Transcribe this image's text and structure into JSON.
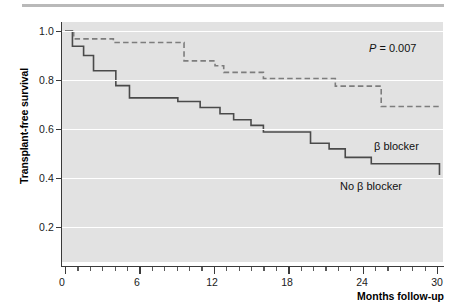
{
  "figure": {
    "title": "",
    "top_rule": true
  },
  "axes": {
    "x_title": "Months follow-up",
    "y_title": "Transplant-free survival",
    "x_ticks": [
      "0",
      "6",
      "12",
      "18",
      "24",
      "30"
    ],
    "y_ticks": [
      "1.0",
      "0.8",
      "0.6",
      "0.4",
      "0.2"
    ]
  },
  "annotations": {
    "p_symbol": "P",
    "p_text": " = 0.007",
    "p_full": "P = 0.007",
    "label_beta": "β blocker",
    "label_no_beta": "No β blocker"
  },
  "colors": {
    "plot_background": "#e2e2e2",
    "gridline": "#ffffff",
    "axis": "#3a3a3a",
    "curve_solid": "#4a4a4a",
    "curve_dashed": "#7d7d7d",
    "page_background": "#ffffff",
    "rule": "#b9b9b9"
  },
  "chart_data": {
    "type": "line",
    "subtype": "kaplan-meier-step",
    "title": "",
    "xlabel": "Months follow-up",
    "ylabel": "Transplant-free survival",
    "xlim": [
      0,
      30.7
    ],
    "ylim": [
      0,
      1.06
    ],
    "x_ticks": [
      0,
      6,
      12,
      18,
      24,
      30
    ],
    "y_ticks": [
      0.2,
      0.4,
      0.6,
      0.8,
      1.0
    ],
    "x_minor_tick_interval": 1,
    "grid": "horizontal-white",
    "legend": "inline-annotations",
    "annotations": [
      {
        "text": "P = 0.007",
        "x": 26.5,
        "y": 1.02
      },
      {
        "text": "β blocker",
        "x": 26.0,
        "y": 0.66
      },
      {
        "text": "No β blocker",
        "x": 23.5,
        "y": 0.5
      }
    ],
    "series": [
      {
        "name": "β blocker",
        "style": "dashed",
        "color": "#7d7d7d",
        "steps": [
          {
            "x": 0.0,
            "y": 1.0
          },
          {
            "x": 0.7,
            "y": 0.968
          },
          {
            "x": 3.9,
            "y": 0.953
          },
          {
            "x": 9.3,
            "y": 0.953
          },
          {
            "x": 9.6,
            "y": 0.878
          },
          {
            "x": 11.8,
            "y": 0.878
          },
          {
            "x": 12.1,
            "y": 0.858
          },
          {
            "x": 12.8,
            "y": 0.831
          },
          {
            "x": 15.7,
            "y": 0.831
          },
          {
            "x": 16.0,
            "y": 0.806
          },
          {
            "x": 21.5,
            "y": 0.806
          },
          {
            "x": 21.8,
            "y": 0.775
          },
          {
            "x": 25.2,
            "y": 0.775
          },
          {
            "x": 25.5,
            "y": 0.692
          },
          {
            "x": 30.2,
            "y": 0.692
          }
        ]
      },
      {
        "name": "No β blocker",
        "style": "solid",
        "color": "#4a4a4a",
        "steps": [
          {
            "x": 0.0,
            "y": 1.0
          },
          {
            "x": 0.6,
            "y": 0.938
          },
          {
            "x": 1.5,
            "y": 0.9
          },
          {
            "x": 2.0,
            "y": 0.9
          },
          {
            "x": 2.3,
            "y": 0.838
          },
          {
            "x": 3.8,
            "y": 0.838
          },
          {
            "x": 4.1,
            "y": 0.777
          },
          {
            "x": 4.9,
            "y": 0.777
          },
          {
            "x": 5.2,
            "y": 0.727
          },
          {
            "x": 8.8,
            "y": 0.727
          },
          {
            "x": 9.1,
            "y": 0.712
          },
          {
            "x": 10.6,
            "y": 0.712
          },
          {
            "x": 10.9,
            "y": 0.688
          },
          {
            "x": 12.2,
            "y": 0.688
          },
          {
            "x": 12.5,
            "y": 0.662
          },
          {
            "x": 13.3,
            "y": 0.662
          },
          {
            "x": 13.6,
            "y": 0.638
          },
          {
            "x": 14.7,
            "y": 0.638
          },
          {
            "x": 15.0,
            "y": 0.615
          },
          {
            "x": 15.7,
            "y": 0.615
          },
          {
            "x": 16.0,
            "y": 0.588
          },
          {
            "x": 19.5,
            "y": 0.588
          },
          {
            "x": 19.8,
            "y": 0.542
          },
          {
            "x": 21.0,
            "y": 0.542
          },
          {
            "x": 21.3,
            "y": 0.519
          },
          {
            "x": 22.3,
            "y": 0.519
          },
          {
            "x": 22.6,
            "y": 0.484
          },
          {
            "x": 24.4,
            "y": 0.484
          },
          {
            "x": 24.7,
            "y": 0.458
          },
          {
            "x": 29.9,
            "y": 0.458
          },
          {
            "x": 30.2,
            "y": 0.412
          }
        ]
      }
    ]
  }
}
